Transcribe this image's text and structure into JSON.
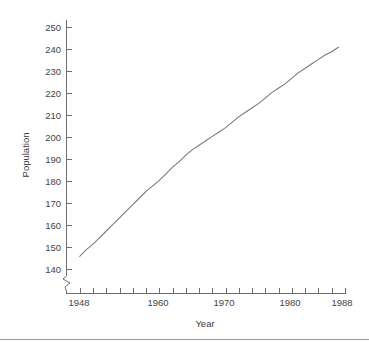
{
  "chart_data": {
    "type": "line",
    "title": "",
    "xlabel": "Year",
    "ylabel": "Population",
    "xlim": [
      1946,
      1988
    ],
    "ylim": [
      138,
      252
    ],
    "grid": false,
    "legend": null,
    "axis_break": {
      "axis": "y",
      "below": 140,
      "symbol": "zigzag"
    },
    "y_ticks": [
      250,
      240,
      230,
      220,
      210,
      200,
      190,
      180,
      170,
      160,
      150,
      140
    ],
    "y_tick_labels": [
      "250",
      "240",
      "230",
      "220",
      "210",
      "200",
      "190",
      "180",
      "170",
      "160",
      "150",
      "140"
    ],
    "x_ticks": [
      1948,
      1950,
      1952,
      1954,
      1956,
      1958,
      1960,
      1962,
      1964,
      1966,
      1968,
      1970,
      1972,
      1974,
      1976,
      1978,
      1980,
      1982,
      1984,
      1986,
      1988
    ],
    "x_tick_labels": [
      "1948",
      "",
      "",
      "",
      "",
      "",
      "1960",
      "",
      "",
      "",
      "",
      "1970",
      "",
      "",
      "",
      "",
      "1980",
      "",
      "",
      "",
      "1988"
    ],
    "x_labeled_ticks": [
      {
        "value": 1948,
        "label": "1948"
      },
      {
        "value": 1960,
        "label": "1960"
      },
      {
        "value": 1970,
        "label": "1970"
      },
      {
        "value": 1980,
        "label": "1980"
      },
      {
        "value": 1988,
        "label": "1988"
      }
    ],
    "x": [
      1948,
      1949,
      1950,
      1951,
      1952,
      1953,
      1954,
      1955,
      1956,
      1957,
      1958,
      1959,
      1960,
      1961,
      1962,
      1963,
      1964,
      1965,
      1966,
      1967,
      1968,
      1969,
      1970,
      1971,
      1972,
      1973,
      1974,
      1975,
      1976,
      1977,
      1978,
      1979,
      1980,
      1981,
      1982,
      1983,
      1984,
      1985,
      1986,
      1987
    ],
    "values": [
      146.0,
      149.0,
      151.5,
      154.5,
      157.5,
      160.5,
      163.5,
      166.5,
      169.5,
      172.5,
      175.5,
      178.0,
      180.5,
      183.5,
      186.5,
      189.0,
      192.0,
      194.5,
      196.5,
      198.5,
      200.5,
      202.5,
      204.5,
      207.0,
      209.5,
      211.5,
      213.5,
      215.5,
      218.0,
      220.5,
      222.5,
      224.5,
      227.0,
      229.5,
      231.5,
      233.5,
      235.5,
      237.5,
      239.0,
      241.0
    ],
    "series": [
      {
        "name": "Population",
        "values": [
          146.0,
          149.0,
          151.5,
          154.5,
          157.5,
          160.5,
          163.5,
          166.5,
          169.5,
          172.5,
          175.5,
          178.0,
          180.5,
          183.5,
          186.5,
          189.0,
          192.0,
          194.5,
          196.5,
          198.5,
          200.5,
          202.5,
          204.5,
          207.0,
          209.5,
          211.5,
          213.5,
          215.5,
          218.0,
          220.5,
          222.5,
          224.5,
          227.0,
          229.5,
          231.5,
          233.5,
          235.5,
          237.5,
          239.0,
          241.0
        ],
        "color": "#7a7a7a"
      }
    ]
  },
  "axes": {
    "y_title": "Population",
    "x_title": "Year"
  },
  "colors": {
    "line": "#7a7a7a",
    "axis": "#6d6d6d",
    "text": "#3a3a3a",
    "rule": "#9a9a9a",
    "background": "#ffffff"
  }
}
